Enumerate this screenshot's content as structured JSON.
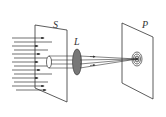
{
  "diagram": {
    "labels": {
      "screen_s": "S",
      "lens": "L",
      "screen_p": "P"
    },
    "colors": {
      "line": "#333333",
      "lens_fill": "#777777",
      "background": "#ffffff"
    },
    "elements": [
      {
        "id": "incident-rays",
        "description": "parallel arrows of incoming light"
      },
      {
        "id": "screen-s",
        "description": "screen with circular aperture"
      },
      {
        "id": "aperture",
        "description": "small circular hole"
      },
      {
        "id": "lens-l",
        "description": "converging lens"
      },
      {
        "id": "screen-p",
        "description": "observation screen with concentric rings"
      }
    ]
  }
}
